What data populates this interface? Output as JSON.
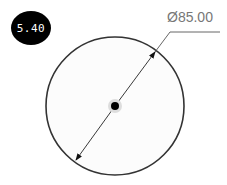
{
  "badge": {
    "label": "5.40"
  },
  "dimension": {
    "label": "Ø85.00",
    "type": "diameter"
  },
  "colors": {
    "badge_bg": "#000000",
    "badge_text": "#ffffff",
    "line": "#333333",
    "dim_text": "#777777"
  }
}
